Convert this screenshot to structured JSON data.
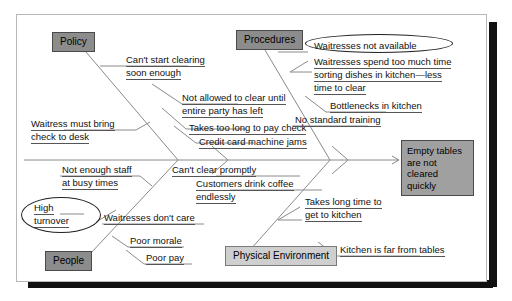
{
  "diagram": {
    "type": "fishbone-cause-and-effect",
    "effect": {
      "label": "Empty tables are not cleared quickly",
      "line1": "Empty tables",
      "line2": "are not cleared",
      "line3": "quickly"
    },
    "categories": [
      {
        "id": "policy",
        "label": "Policy",
        "position": "upper-left",
        "shade": "dark"
      },
      {
        "id": "procedures",
        "label": "Procedures",
        "position": "upper-right",
        "shade": "dark"
      },
      {
        "id": "people",
        "label": "People",
        "position": "lower-left",
        "shade": "dark"
      },
      {
        "id": "physical-environment",
        "label": "Physical Environment",
        "position": "lower-right",
        "shade": "light"
      }
    ],
    "causes": {
      "policy": [
        {
          "id": "cant-start-clearing",
          "line1": "Can't start clearing",
          "line2": "soon enough",
          "circled": false
        },
        {
          "id": "not-allowed-to-clear",
          "line1": "Not allowed to clear until",
          "line2": "entire party has left",
          "circled": false
        },
        {
          "id": "takes-too-long-pay-check",
          "line1": "Takes too long to pay check",
          "line2": "",
          "circled": false
        },
        {
          "id": "credit-card-machine-jams",
          "line1": "Credit card machine jams",
          "line2": "",
          "circled": false
        },
        {
          "id": "waitress-must-bring-check",
          "line1": "Waitress must bring",
          "line2": "check to desk",
          "circled": false
        }
      ],
      "procedures": [
        {
          "id": "waitresses-not-available",
          "line1": "Waitresses not available",
          "line2": "",
          "circled": true
        },
        {
          "id": "waitresses-sorting-dishes",
          "line1": "Waitresses spend too much time",
          "line2": "sorting dishes in kitchen—less",
          "line3": "time to clear",
          "circled": false
        },
        {
          "id": "bottlenecks-in-kitchen",
          "line1": "Bottlenecks in kitchen",
          "line2": "",
          "circled": false
        },
        {
          "id": "no-standard-training",
          "line1": "No standard training",
          "line2": "",
          "circled": false
        }
      ],
      "people": [
        {
          "id": "not-enough-staff",
          "line1": "Not enough staff",
          "line2": "at busy times",
          "circled": false
        },
        {
          "id": "high-turnover",
          "line1": "High",
          "line2": "turnover",
          "circled": true
        },
        {
          "id": "waitresses-dont-care",
          "line1": "Waitresses don't care",
          "line2": "",
          "circled": false
        },
        {
          "id": "poor-morale",
          "line1": "Poor morale",
          "line2": "",
          "circled": false
        },
        {
          "id": "poor-pay",
          "line1": "Poor pay",
          "line2": "",
          "circled": false
        }
      ],
      "physical-environment": [
        {
          "id": "cant-clear-promptly",
          "line1": "Can't clear promptly",
          "line2": "",
          "circled": false
        },
        {
          "id": "customers-drink-coffee",
          "line1": "Customers drink coffee",
          "line2": "endlessly",
          "circled": false
        },
        {
          "id": "takes-long-time-to-kitchen",
          "line1": "Takes long time to",
          "line2": "get to kitchen",
          "circled": false
        },
        {
          "id": "kitchen-far-from-tables",
          "line1": "Kitchen is far from tables",
          "line2": "",
          "circled": false
        }
      ]
    },
    "colors": {
      "category_box_dark": "#8c8c8c",
      "category_box_light": "#cfcfcf",
      "effect_box": "#a0a0a0",
      "line": "#8a8a8a",
      "text": "#111111",
      "page": "#ffffff",
      "shadow": "#111111"
    }
  }
}
